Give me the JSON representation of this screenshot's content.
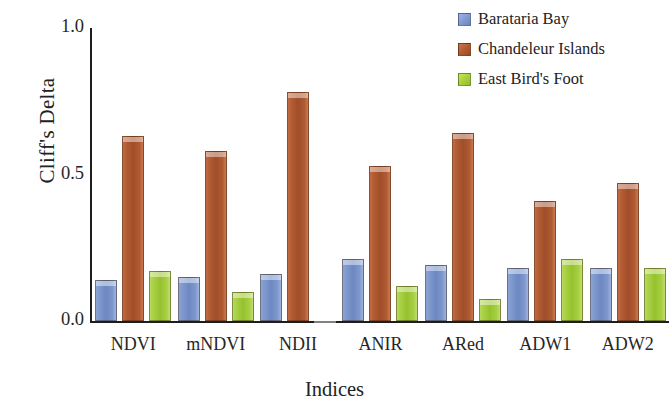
{
  "chart_data": {
    "type": "bar",
    "title": "",
    "xlabel": "Indices",
    "ylabel": "Cliff's Delta",
    "categories": [
      "NDVI",
      "mNDVI",
      "NDII",
      "ANIR",
      "ARed",
      "ADW1",
      "ADW2"
    ],
    "series": [
      {
        "name": "Barataria Bay",
        "color": "#7f99ce",
        "values": [
          0.14,
          0.15,
          0.16,
          0.21,
          0.19,
          0.18,
          0.18
        ]
      },
      {
        "name": "Chandeleur Islands",
        "color": "#b05a31",
        "values": [
          0.63,
          0.58,
          0.78,
          0.53,
          0.64,
          0.41,
          0.47
        ]
      },
      {
        "name": "East Bird's Foot",
        "color": "#a5cd3c",
        "values": [
          0.17,
          0.1,
          null,
          0.12,
          0.075,
          0.21,
          0.18
        ]
      }
    ],
    "ylim": [
      0.0,
      1.0
    ],
    "ytick_labels": [
      "0.0",
      "0.5",
      "1.0"
    ],
    "ytick_values": [
      0.0,
      0.5,
      1.0
    ],
    "grid": false,
    "legend_position": "top-right"
  },
  "legend": {
    "items": [
      {
        "label": "Barataria Bay",
        "color": "#7f99ce"
      },
      {
        "label": "Chandeleur Islands",
        "color": "#b05a31"
      },
      {
        "label": "East Bird's Foot",
        "color": "#a5cd3c"
      }
    ]
  },
  "axes": {
    "y_title": "Cliff's Delta",
    "x_title": "Indices",
    "y_ticks": [
      "1.0",
      "0.5",
      "0.0"
    ],
    "x_ticks": [
      "NDVI",
      "mNDVI",
      "NDII",
      "ANIR",
      "ARed",
      "ADW1",
      "ADW2"
    ]
  }
}
